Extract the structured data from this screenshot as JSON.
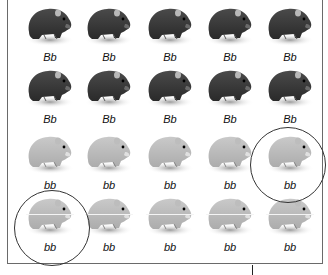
{
  "figure": {
    "rows": [
      {
        "phenotype": "dark",
        "labels": [
          "Bb",
          "Bb",
          "Bb",
          "Bb",
          "Bb"
        ]
      },
      {
        "phenotype": "dark",
        "labels": [
          "Bb",
          "Bb",
          "Bb",
          "Bb",
          "Bb"
        ]
      },
      {
        "phenotype": "light",
        "labels": [
          "bb",
          "bb",
          "bb",
          "bb",
          "bb"
        ]
      },
      {
        "phenotype": "light",
        "labels": [
          "bb",
          "bb",
          "bb",
          "bb",
          "bb"
        ]
      }
    ],
    "circled": [
      {
        "row": 3,
        "col": 5,
        "label": "bb"
      },
      {
        "row": 4,
        "col": 1,
        "label": "bb"
      }
    ],
    "colors": {
      "dark_fur": "#2b2b2b",
      "light_fur": "#a8a8a8",
      "border": "#6a6a6a",
      "circle": "#333333"
    }
  }
}
